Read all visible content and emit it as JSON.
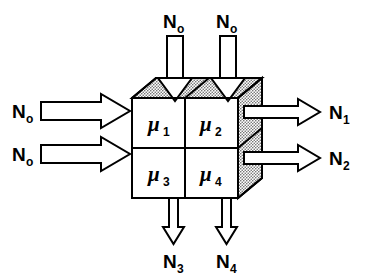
{
  "diagram": {
    "type": "schematic",
    "background_color": "#ffffff",
    "line_color": "#000000",
    "stipple_fill_color": "#d9d9d9",
    "cube": {
      "faces": {
        "front": {
          "name": "front-face",
          "fill": "#ffffff",
          "cells": 4
        },
        "top": {
          "name": "top-face",
          "fill": "stippled",
          "cells": 2
        },
        "right": {
          "name": "right-face",
          "fill": "stippled",
          "cells": 2
        }
      },
      "cells": [
        {
          "id": "cell-mu1",
          "symbol": "μ",
          "subscript": "1",
          "position": "top-left"
        },
        {
          "id": "cell-mu2",
          "symbol": "μ",
          "subscript": "2",
          "position": "top-right"
        },
        {
          "id": "cell-mu3",
          "symbol": "μ",
          "subscript": "3",
          "position": "bottom-left"
        },
        {
          "id": "cell-mu4",
          "symbol": "μ",
          "subscript": "4",
          "position": "bottom-right"
        }
      ]
    },
    "flows": {
      "inputs_left": [
        {
          "id": "in-left-top",
          "symbol": "N",
          "subscript": "o",
          "direction": "right",
          "style": "thick-block-arrow"
        },
        {
          "id": "in-left-bottom",
          "symbol": "N",
          "subscript": "o",
          "direction": "right",
          "style": "thick-block-arrow"
        }
      ],
      "inputs_top": [
        {
          "id": "in-top-left",
          "symbol": "N",
          "subscript": "o",
          "direction": "down",
          "style": "narrow-shaft-wide-head"
        },
        {
          "id": "in-top-right",
          "symbol": "N",
          "subscript": "o",
          "direction": "down",
          "style": "narrow-shaft-wide-head"
        }
      ],
      "outputs_right": [
        {
          "id": "out-right-top",
          "symbol": "N",
          "subscript": "1",
          "direction": "right",
          "style": "thin-block-arrow"
        },
        {
          "id": "out-right-bottom",
          "symbol": "N",
          "subscript": "2",
          "direction": "right",
          "style": "thin-block-arrow"
        }
      ],
      "outputs_bottom": [
        {
          "id": "out-bottom-left",
          "symbol": "N",
          "subscript": "3",
          "direction": "down",
          "style": "thin-shaft-small-head"
        },
        {
          "id": "out-bottom-right",
          "symbol": "N",
          "subscript": "4",
          "direction": "down",
          "style": "thin-shaft-small-head"
        }
      ]
    }
  },
  "labels": {
    "n0_left_top": {
      "base": "N",
      "sub": "o"
    },
    "n0_left_bottom": {
      "base": "N",
      "sub": "o"
    },
    "n0_top_left": {
      "base": "N",
      "sub": "o"
    },
    "n0_top_right": {
      "base": "N",
      "sub": "o"
    },
    "n1": {
      "base": "N",
      "sub": "1"
    },
    "n2": {
      "base": "N",
      "sub": "2"
    },
    "n3": {
      "base": "N",
      "sub": "3"
    },
    "n4": {
      "base": "N",
      "sub": "4"
    },
    "mu1": {
      "base": "μ",
      "sub": "1"
    },
    "mu2": {
      "base": "μ",
      "sub": "2"
    },
    "mu3": {
      "base": "μ",
      "sub": "3"
    },
    "mu4": {
      "base": "μ",
      "sub": "4"
    }
  }
}
